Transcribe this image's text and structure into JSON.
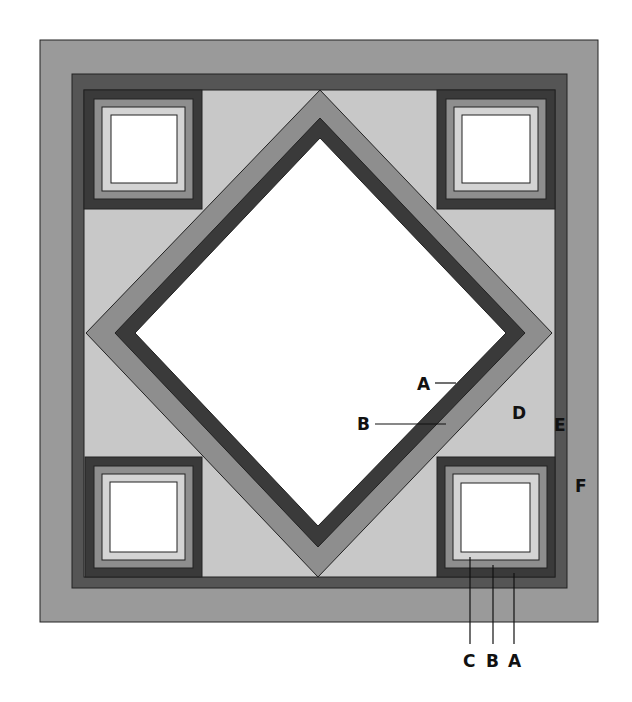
{
  "diagram": {
    "colors": {
      "F_border": "#9a9a9a",
      "E_band": "#555555",
      "D_background": "#c8c8c8",
      "A_dark": "#3a3a3a",
      "B_medium": "#8e8e8e",
      "C_light": "#d4d4d4",
      "center_white": "#ffffff",
      "outline": "#222222"
    },
    "labels": {
      "diamond_A": "A",
      "diamond_B": "B",
      "background_D": "D",
      "band_E": "E",
      "border_F": "F",
      "corner_C": "C",
      "corner_B": "B",
      "corner_A": "A"
    },
    "corner_blocks": [
      "top-left",
      "top-right",
      "bottom-left",
      "bottom-right"
    ]
  }
}
